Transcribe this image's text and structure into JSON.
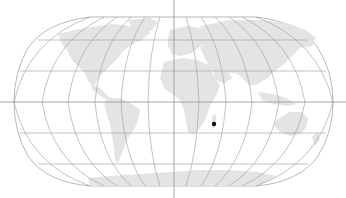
{
  "map": {
    "projection": "robinson",
    "width": 346,
    "height": 198,
    "colors": {
      "background": "#ffffff",
      "land": "#e4e4e4",
      "graticule": "#9a9a9a",
      "crosshair": "#8f8f8f",
      "marker": "#111111"
    },
    "crosshair": {
      "x": 174,
      "y": 102
    },
    "marker": {
      "x": 214,
      "y": 124,
      "radius": 2.2,
      "label": ""
    },
    "graticule": {
      "meridian_step_deg": 30,
      "parallel_step_deg": 30
    }
  }
}
